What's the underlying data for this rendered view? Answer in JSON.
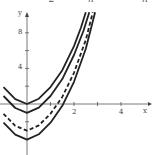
{
  "top_labels": [
    {
      "text": "2",
      "x": 49
    },
    {
      "text": "n",
      "x": 88
    },
    {
      "text": "n",
      "x": 142
    }
  ],
  "chart_data": {
    "type": "line",
    "title": "",
    "xlabel": "x",
    "ylabel": "y",
    "xlim": [
      -1.15,
      4.6
    ],
    "ylim": [
      -5.5,
      10.5
    ],
    "grid": false,
    "legend": null,
    "x_ticks": [
      1,
      2,
      3,
      4
    ],
    "x_tick_labels": [
      "",
      "2",
      "",
      "4"
    ],
    "y_ticks": [
      2,
      4,
      6,
      8,
      -2
    ],
    "y_tick_labels": [
      "",
      "4",
      "",
      "8",
      ""
    ],
    "series": [
      {
        "name": "curve-min-0",
        "style": "solid",
        "minimum": 0,
        "x": [
          -1.0,
          -0.5,
          0.0,
          0.5,
          1.0,
          1.5,
          2.0,
          2.3,
          2.5
        ],
        "y": [
          1.9,
          0.55,
          0.0,
          0.6,
          1.9,
          3.8,
          6.5,
          8.6,
          10.3
        ]
      },
      {
        "name": "curve-min-neg1",
        "style": "solid",
        "minimum": -1,
        "x": [
          -1.0,
          -0.5,
          0.0,
          0.5,
          1.0,
          1.5,
          2.0,
          2.4,
          2.65
        ],
        "y": [
          0.9,
          -0.45,
          -1.0,
          -0.4,
          0.9,
          2.8,
          5.5,
          8.2,
          10.3
        ]
      },
      {
        "name": "curve-min-neg3",
        "style": "dashed",
        "minimum": -3,
        "x": [
          -1.0,
          -0.5,
          0.0,
          0.5,
          1.0,
          1.5,
          2.0,
          2.5,
          2.8
        ],
        "y": [
          -1.1,
          -2.45,
          -3.0,
          -2.4,
          -1.1,
          0.8,
          3.5,
          7.2,
          10.3
        ]
      },
      {
        "name": "curve-min-neg4",
        "style": "solid",
        "minimum": -4,
        "x": [
          -1.0,
          -0.5,
          0.0,
          0.5,
          1.0,
          1.5,
          2.0,
          2.5,
          2.9
        ],
        "y": [
          -2.1,
          -3.45,
          -4.0,
          -3.4,
          -2.1,
          -0.2,
          2.5,
          6.2,
          10.3
        ]
      }
    ]
  },
  "axes": {
    "x_label": "x",
    "y_label": "y"
  }
}
